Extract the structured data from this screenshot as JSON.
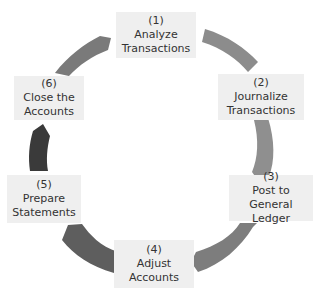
{
  "diagram": {
    "type": "cycle",
    "title": "",
    "colors": {
      "box_bg": "#efefef",
      "text": "#333333",
      "arrow_1_2": "#8c8c8c",
      "arrow_2_3": "#8f8f8f",
      "arrow_3_4": "#7d7d7d",
      "arrow_4_5": "#5e5e5e",
      "arrow_5_6": "#3a3a3a",
      "arrow_6_1": "#7a7a7a"
    },
    "steps": [
      {
        "num": "(1)",
        "line1": "Analyze",
        "line2": "Transactions"
      },
      {
        "num": "(2)",
        "line1": "Journalize",
        "line2": "Transactions"
      },
      {
        "num": "(3)",
        "line1": "Post to",
        "line2": "General Ledger"
      },
      {
        "num": "(4)",
        "line1": "Adjust",
        "line2": "Accounts"
      },
      {
        "num": "(5)",
        "line1": "Prepare",
        "line2": "Statements"
      },
      {
        "num": "(6)",
        "line1": "Close the",
        "line2": "Accounts"
      }
    ]
  }
}
